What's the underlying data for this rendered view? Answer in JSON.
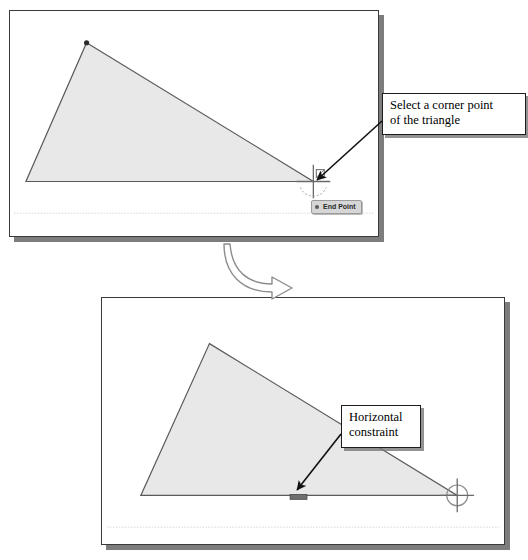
{
  "figure": {
    "title": "",
    "background_color": "#ffffff"
  },
  "colors": {
    "panel_border": "#3a3a3a",
    "panel_background": "#ffffff",
    "panel_shadow": "#7d7d7d",
    "shape_fill": "#e8e8e8",
    "shape_stroke": "#5a5a5a",
    "vertex_dot": "#2b2b2b",
    "cursor": "#6a6a6a",
    "constraint_marker": "#6e6e6e",
    "callout_border": "#1c1c1c",
    "callout_text": "#000000",
    "tooltip_background": "#d6d6d6",
    "tooltip_border": "#9a9a9a",
    "tooltip_text": "#2a2a2a",
    "arrow": "#101010",
    "transition_arrow_stroke": "#8c8c8c",
    "guide_line": "#d8d8d8"
  },
  "step_one": {
    "name": "select-corner-point-step",
    "panel": {
      "x": 9,
      "y": 10,
      "width": 370,
      "height": 227
    },
    "shape": {
      "name": "triangle",
      "vertices": [
        {
          "label": "top",
          "x": 86,
          "y": 42
        },
        {
          "label": "bottom-right",
          "x": 314,
          "y": 182
        },
        {
          "label": "bottom-left",
          "x": 25,
          "y": 182
        }
      ],
      "highlighted_vertex": {
        "x": 86,
        "y": 42
      }
    },
    "cursor": {
      "x": 314,
      "y": 182,
      "type": "crosshair-endpoint"
    },
    "tooltip": {
      "label": "End Point",
      "x": 310,
      "y": 199
    },
    "guide_line_y": 214,
    "callout": {
      "label": "Select a corner point\nof the triangle",
      "x": 382,
      "y": 93,
      "width": 144,
      "height": 42
    },
    "arrow": {
      "from_x": 382,
      "from_y": 121,
      "to_x": 317,
      "to_y": 180
    }
  },
  "transition": {
    "name": "flow-arrow",
    "label": "",
    "x": 224,
    "y": 244,
    "width": 70,
    "height": 48
  },
  "step_two": {
    "name": "horizontal-constraint-step",
    "panel": {
      "x": 101,
      "y": 297,
      "width": 404,
      "height": 248
    },
    "shape": {
      "name": "triangle",
      "vertices": [
        {
          "label": "top",
          "x": 209,
          "y": 343
        },
        {
          "label": "bottom-right",
          "x": 458,
          "y": 496
        },
        {
          "label": "bottom-left",
          "x": 140,
          "y": 496
        }
      ]
    },
    "cursor": {
      "x": 458,
      "y": 496,
      "type": "crosshair-circle"
    },
    "constraint_marker": {
      "x": 290,
      "y": 495,
      "width": 17,
      "height": 5
    },
    "guide_line_y": 528,
    "callout": {
      "label": "Horizontal\nconstraint",
      "x": 341,
      "y": 405,
      "width": 80,
      "height": 43
    },
    "arrow": {
      "from_x": 341,
      "from_y": 434,
      "to_x": 297,
      "to_y": 490
    }
  }
}
